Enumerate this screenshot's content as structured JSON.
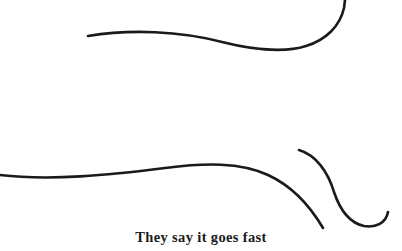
{
  "page": {
    "background_color": "#ffffff",
    "width": 402,
    "height": 251
  },
  "caption": {
    "text": "They say it goes fast",
    "color": "#1b1b1b",
    "font_style": "bold-serif",
    "font_size_px": 14.5,
    "align": "center"
  },
  "artwork": {
    "title": "flowing-line-drawing",
    "stroke_color": "#1a1a1a",
    "stroke_width_px": 2.6,
    "stroke_count": 3,
    "strokes": [
      {
        "name": "upper-sweep-with-loop",
        "description": "Long tapered line entering at left, dipping through the middle, then curving up into a loop that exits the top edge on the right.",
        "path": "M 88 36 C 130 29, 180 31, 222 42 C 258 51, 288 52, 306 46 C 326 40, 340 26, 344 8 L 345 0",
        "start_point": [
          88,
          36
        ],
        "end_point": [
          345,
          0
        ],
        "linecap": "round"
      },
      {
        "name": "lower-sweep-descending",
        "description": "Long line entering at the left edge, rising to a crest near the middle, then falling steeply to a tapered end at lower right.",
        "path": "M 0 175 C 50 181, 110 175, 165 168 C 205 163, 240 162, 268 175 C 292 186, 310 206, 323 228",
        "start_point": [
          0,
          175
        ],
        "end_point": [
          323,
          228
        ],
        "linecap": "round"
      },
      {
        "name": "s-curve-with-hook",
        "description": "Short blunt-started stroke that bows down and right, then flattens at the bottom and hooks back upward.",
        "path": "M 299 150 C 316 155, 328 172, 334 192 C 340 210, 350 223, 364 226 C 376 228, 386 223, 388 212",
        "start_point": [
          299,
          150
        ],
        "end_point": [
          388,
          212
        ],
        "linecap": "round"
      }
    ]
  }
}
